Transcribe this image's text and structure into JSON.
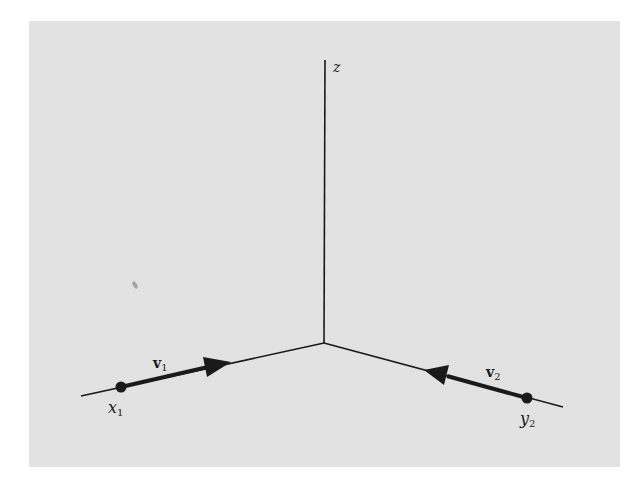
{
  "figure": {
    "background_color": "#e2e2e2",
    "line_color": "#1a1a1a",
    "axes": {
      "z_label": "z",
      "origin": [
        324,
        343
      ],
      "z_top": [
        325,
        60
      ],
      "left_end": [
        81,
        396
      ],
      "right_end": [
        563,
        407
      ]
    },
    "left_particle": {
      "point_label": "x",
      "point_sub": "1",
      "vector_label": "v",
      "vector_sub": "1",
      "dot": [
        121,
        387
      ],
      "arrow_tip": [
        230,
        362
      ]
    },
    "right_particle": {
      "point_label": "y",
      "point_sub": "2",
      "vector_label": "v",
      "vector_sub": "2",
      "dot": [
        527,
        398
      ],
      "arrow_tip": [
        425,
        370
      ]
    }
  }
}
